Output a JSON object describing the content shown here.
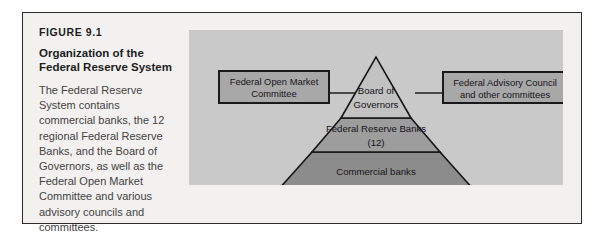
{
  "figure": {
    "number": "FIGURE 9.1",
    "title_line1": "Organization of the",
    "title_line2": "Federal Reserve System",
    "body": "The Federal Reserve System contains commercial banks, the 12 regional Federal Reserve Banks, and the Board of Governors, as well as the Federal Open Market Committee and various advisory councils and committees."
  },
  "diagram": {
    "left_box": {
      "line1": "Federal Open Market",
      "line2": "Committee"
    },
    "right_box": {
      "line1": "Federal Advisory Council",
      "line2": "and other committees"
    },
    "pyramid": {
      "tier_top": {
        "line1": "Board of",
        "line2": "Governors"
      },
      "tier_middle": {
        "line1": "Federal Reserve Banks",
        "line2": "(12)"
      },
      "tier_bottom": {
        "line1": "Commercial banks"
      }
    }
  },
  "colors": {
    "card_background": "#f2f1ef",
    "card_border": "#2b2b2b",
    "panel_background": "#c9c9c9",
    "box_fill": "#a8a8a8",
    "box_stroke": "#1a1a1a",
    "tier_top_fill": "#c2c2c2",
    "tier_middle_fill": "#9d9d9d",
    "tier_bottom_fill": "#8c8c8c",
    "pyramid_stroke": "#161616",
    "connector": "#2a2a2a",
    "title_text": "#1d1d1d",
    "body_text": "#44423f"
  }
}
